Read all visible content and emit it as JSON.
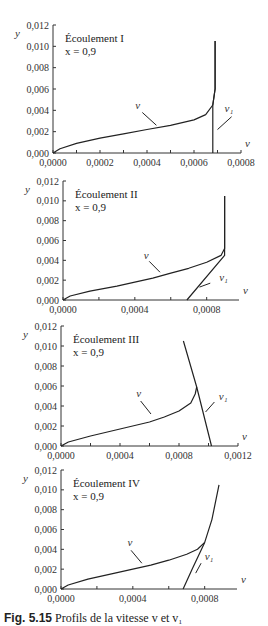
{
  "caption": {
    "prefix": "Fig. 5.15",
    "text": "Profils de la vitesse v et v₁"
  },
  "chart_data": [
    {
      "type": "line",
      "title": "Écoulement I",
      "subtitle": "x = 0,9",
      "xlabel": "v",
      "ylabel": "y",
      "xlim": [
        0,
        0.0008
      ],
      "ylim": [
        0,
        0.012
      ],
      "xticks": [
        "0,0000",
        "0,0002",
        "0,0004",
        "0,0006",
        "0,0008"
      ],
      "xtick_values": [
        0,
        0.0002,
        0.0004,
        0.0006,
        0.0008
      ],
      "xminor": [
        0.0001,
        0.0003,
        0.0005,
        0.0007
      ],
      "yticks": [
        "0,000",
        "0,002",
        "0,004",
        "0,006",
        "0,008",
        "0,010",
        "0,012"
      ],
      "ytick_values": [
        0,
        0.002,
        0.004,
        0.006,
        0.008,
        0.01,
        0.012
      ],
      "grid": false,
      "frame": {
        "x0": 53,
        "y0": 153,
        "x1": 241,
        "y1": 25
      },
      "series": [
        {
          "name": "v",
          "points": [
            [
              0,
              0
            ],
            [
              3e-05,
              0.0004
            ],
            [
              0.0001,
              0.0009
            ],
            [
              0.0002,
              0.0014
            ],
            [
              0.0003,
              0.0018
            ],
            [
              0.0004,
              0.0022
            ],
            [
              0.0005,
              0.0026
            ],
            [
              0.0006,
              0.0031
            ],
            [
              0.00065,
              0.0036
            ],
            [
              0.00068,
              0.0045
            ],
            [
              0.00069,
              0.006
            ],
            [
              0.00069,
              0.0105
            ]
          ]
        },
        {
          "name": "v₁",
          "points": [
            [
              0.00068,
              0
            ],
            [
              0.00068,
              0.0045
            ],
            [
              0.00069,
              0.006
            ],
            [
              0.00069,
              0.0105
            ]
          ]
        }
      ],
      "annotations": [
        {
          "text": "v",
          "at": [
            0.00035,
            0.0041
          ],
          "leader": [
            [
              0.00038,
              0.0038
            ],
            [
              0.00044,
              0.0026
            ]
          ]
        },
        {
          "text": "v₁",
          "at": [
            0.00073,
            0.0038
          ],
          "leader": [
            [
              0.00076,
              0.0034
            ],
            [
              0.0007,
              0.0022
            ]
          ]
        }
      ]
    },
    {
      "type": "line",
      "title": "Écoulement II",
      "subtitle": "x = 0,9",
      "xlabel": "v",
      "ylabel": "y",
      "xlim": [
        0,
        0.00098
      ],
      "ylim": [
        0,
        0.012
      ],
      "xticks": [
        "0,0000",
        "0,0004",
        "0,0008"
      ],
      "xtick_values": [
        0,
        0.0004,
        0.0008
      ],
      "xminor": [
        0.0002,
        0.0006
      ],
      "yticks": [
        "0,000",
        "0,002",
        "0,004",
        "0,006",
        "0,008",
        "0,010",
        "0,012"
      ],
      "ytick_values": [
        0,
        0.002,
        0.004,
        0.006,
        0.008,
        0.01,
        0.012
      ],
      "grid": false,
      "frame": {
        "x0": 63,
        "y0": 300,
        "x1": 239,
        "y1": 181
      },
      "series": [
        {
          "name": "v",
          "points": [
            [
              0,
              0
            ],
            [
              4e-05,
              0.0004
            ],
            [
              0.00015,
              0.0009
            ],
            [
              0.0003,
              0.0014
            ],
            [
              0.0004,
              0.0018
            ],
            [
              0.0005,
              0.0022
            ],
            [
              0.0006,
              0.0027
            ],
            [
              0.0007,
              0.0032
            ],
            [
              0.0008,
              0.0038
            ],
            [
              0.00088,
              0.0045
            ],
            [
              0.0009,
              0.0052
            ],
            [
              0.0009,
              0.0105
            ]
          ]
        },
        {
          "name": "v₁",
          "points": [
            [
              0.00069,
              0
            ],
            [
              0.0009,
              0.0045
            ],
            [
              0.0009,
              0.0052
            ],
            [
              0.0009,
              0.0105
            ]
          ]
        }
      ],
      "annotations": [
        {
          "text": "v",
          "at": [
            0.00045,
            0.0041
          ],
          "leader": [
            [
              0.00048,
              0.0039
            ],
            [
              0.00054,
              0.0028
            ]
          ]
        },
        {
          "text": "v₁",
          "at": [
            0.00087,
            0.0019
          ],
          "leader": [
            [
              0.00082,
              0.0017
            ],
            [
              0.00076,
              0.0013
            ]
          ]
        }
      ]
    },
    {
      "type": "line",
      "title": "Écoulement III",
      "subtitle": "x = 0,9",
      "xlabel": "v",
      "ylabel": "y",
      "xlim": [
        0,
        0.0012
      ],
      "ylim": [
        0,
        0.012
      ],
      "xticks": [
        "0,0000",
        "0,0004",
        "0,0008",
        "0,0012"
      ],
      "xtick_values": [
        0,
        0.0004,
        0.0008,
        0.0012
      ],
      "xminor": [
        0.0002,
        0.0006,
        0.001
      ],
      "yticks": [
        "0,000",
        "0,002",
        "0,004",
        "0,006",
        "0,008",
        "0,010",
        "0,012"
      ],
      "ytick_values": [
        0,
        0.002,
        0.004,
        0.006,
        0.008,
        0.01,
        0.012
      ],
      "grid": false,
      "frame": {
        "x0": 61,
        "y0": 446,
        "x1": 238,
        "y1": 326
      },
      "series": [
        {
          "name": "v",
          "points": [
            [
              0,
              0
            ],
            [
              5e-05,
              0.0004
            ],
            [
              0.0002,
              0.001
            ],
            [
              0.0004,
              0.0017
            ],
            [
              0.0006,
              0.0024
            ],
            [
              0.0007,
              0.0029
            ],
            [
              0.0008,
              0.0035
            ],
            [
              0.00088,
              0.0043
            ],
            [
              0.00091,
              0.0052
            ],
            [
              0.00092,
              0.0059
            ]
          ]
        },
        {
          "name": "v₁",
          "points": [
            [
              0.00083,
              0.0105
            ],
            [
              0.00092,
              0.0059
            ],
            [
              0.00102,
              0
            ]
          ]
        }
      ],
      "annotations": [
        {
          "text": "v",
          "at": [
            0.00051,
            0.0049
          ],
          "leader": [
            [
              0.00054,
              0.0045
            ],
            [
              0.00061,
              0.0032
            ]
          ]
        },
        {
          "text": "v₁",
          "at": [
            0.00107,
            0.0046
          ],
          "leader": [
            [
              0.00104,
              0.0044
            ],
            [
              0.00098,
              0.0034
            ]
          ]
        }
      ]
    },
    {
      "type": "line",
      "title": "Écoulement IV",
      "subtitle": "x = 0,9",
      "xlabel": "v",
      "ylabel": "y",
      "xlim": [
        0,
        0.00098
      ],
      "ylim": [
        0,
        0.012
      ],
      "xticks": [
        "0,0000",
        "0,0004",
        "0,0008"
      ],
      "xtick_values": [
        0,
        0.0004,
        0.0008
      ],
      "xminor": [
        0.0002,
        0.0006
      ],
      "yticks": [
        "0,000",
        "0,002",
        "0,004",
        "0,006",
        "0,008",
        "0,010",
        "0,012"
      ],
      "ytick_values": [
        0,
        0.002,
        0.004,
        0.006,
        0.008,
        0.01,
        0.012
      ],
      "grid": false,
      "frame": {
        "x0": 61,
        "y0": 589,
        "x1": 237,
        "y1": 470
      },
      "series": [
        {
          "name": "v",
          "points": [
            [
              0,
              0
            ],
            [
              4e-05,
              0.0004
            ],
            [
              0.00015,
              0.001
            ],
            [
              0.0003,
              0.0016
            ],
            [
              0.0004,
              0.002
            ],
            [
              0.0005,
              0.0024
            ],
            [
              0.0006,
              0.0029
            ],
            [
              0.0007,
              0.0035
            ],
            [
              0.00076,
              0.004
            ],
            [
              0.0008,
              0.0047
            ]
          ]
        },
        {
          "name": "v₁",
          "points": [
            [
              0.00068,
              0
            ],
            [
              0.00073,
              0.002
            ],
            [
              0.0008,
              0.0047
            ],
            [
              0.00084,
              0.007
            ],
            [
              0.00088,
              0.0105
            ]
          ]
        }
      ],
      "annotations": [
        {
          "text": "v",
          "at": [
            0.00037,
            0.0043
          ],
          "leader": [
            [
              0.00039,
              0.0039
            ],
            [
              0.00045,
              0.0026
            ]
          ]
        },
        {
          "text": "v₁",
          "at": [
            0.0008,
            0.0029
          ],
          "leader": [
            [
              0.00078,
              0.0026
            ],
            [
              0.00075,
              0.0016
            ]
          ]
        }
      ]
    }
  ]
}
